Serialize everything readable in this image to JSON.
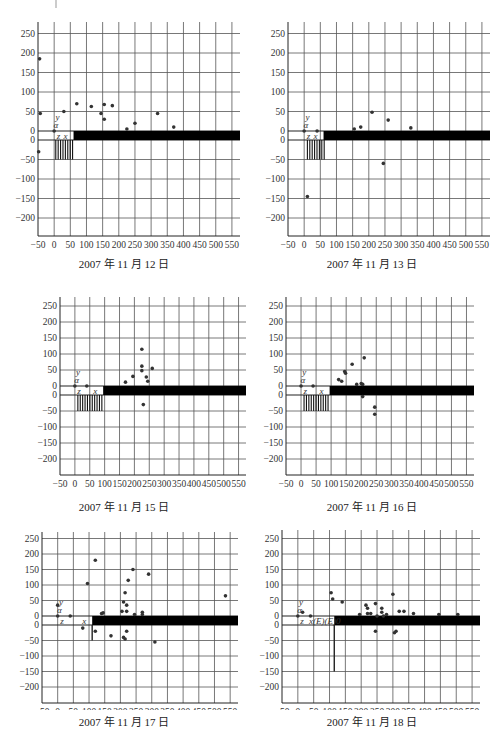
{
  "chart_data": [
    {
      "type": "scatter",
      "title": "2007 年 11 月 12 日",
      "xlabel": "x",
      "ylabel": "y",
      "xticks": [
        -50,
        0,
        50,
        100,
        150,
        200,
        250,
        300,
        350,
        400,
        450,
        500,
        550
      ],
      "yticks": [
        250,
        200,
        150,
        100,
        50,
        0,
        0,
        -50,
        -100,
        -150,
        -200
      ],
      "xlim": [
        -50,
        575
      ],
      "ylim": [
        -250,
        275
      ],
      "origin_labels": [
        "α",
        "y",
        "z",
        "x"
      ],
      "band": {
        "x_start": 60,
        "x_end": 575,
        "y_top": 8,
        "y_bottom": -8
      },
      "hatch": {
        "x_start": 5,
        "x_end": 60,
        "y_top": 0,
        "y_bottom": -50
      },
      "points": [
        [
          -45,
          185
        ],
        [
          -43,
          45
        ],
        [
          -48,
          -30
        ],
        [
          0,
          0
        ],
        [
          30,
          50
        ],
        [
          70,
          70
        ],
        [
          115,
          63
        ],
        [
          145,
          45
        ],
        [
          155,
          68
        ],
        [
          155,
          30
        ],
        [
          180,
          65
        ],
        [
          250,
          20
        ],
        [
          225,
          5
        ],
        [
          320,
          45
        ],
        [
          370,
          10
        ]
      ]
    },
    {
      "type": "scatter",
      "title": "2007 年 11 月 13 日",
      "xlabel": "x",
      "ylabel": "y",
      "xticks": [
        -50,
        0,
        50,
        100,
        150,
        200,
        250,
        300,
        350,
        400,
        450,
        500,
        550
      ],
      "yticks": [
        250,
        200,
        150,
        100,
        50,
        0,
        0,
        -50,
        -100,
        -150,
        -200
      ],
      "xlim": [
        -50,
        575
      ],
      "ylim": [
        -250,
        275
      ],
      "origin_labels": [
        "α",
        "y",
        "z",
        "x"
      ],
      "band": {
        "x_start": 60,
        "x_end": 575,
        "y_top": 8,
        "y_bottom": -8
      },
      "hatch": {
        "x_start": 10,
        "x_end": 65,
        "y_top": 0,
        "y_bottom": -50
      },
      "points": [
        [
          0,
          0
        ],
        [
          10,
          -145
        ],
        [
          40,
          0
        ],
        [
          155,
          5
        ],
        [
          175,
          10
        ],
        [
          210,
          48
        ],
        [
          245,
          -60
        ],
        [
          260,
          28
        ],
        [
          330,
          8
        ]
      ]
    },
    {
      "type": "scatter",
      "title": "2007 年 11 月 15 日",
      "xlabel": "x",
      "ylabel": "y",
      "xticks": [
        -50,
        0,
        50,
        100,
        150,
        200,
        250,
        300,
        350,
        400,
        450,
        500,
        550
      ],
      "yticks": [
        250,
        200,
        150,
        100,
        50,
        0,
        0,
        -50,
        -100,
        -150,
        -200
      ],
      "xlim": [
        -50,
        575
      ],
      "ylim": [
        -250,
        275
      ],
      "origin_labels": [
        "α",
        "y",
        "z",
        "x"
      ],
      "band": {
        "x_start": 95,
        "x_end": 575,
        "y_top": 8,
        "y_bottom": -8
      },
      "hatch": {
        "x_start": 10,
        "x_end": 95,
        "y_top": 0,
        "y_bottom": -50
      },
      "points": [
        [
          0,
          0
        ],
        [
          40,
          0
        ],
        [
          170,
          12
        ],
        [
          195,
          30
        ],
        [
          225,
          115
        ],
        [
          225,
          62
        ],
        [
          225,
          48
        ],
        [
          230,
          -30
        ],
        [
          240,
          28
        ],
        [
          245,
          15
        ],
        [
          260,
          55
        ]
      ]
    },
    {
      "type": "scatter",
      "title": "2007 年 11 月 16 日",
      "xlabel": "x",
      "ylabel": "y",
      "xticks": [
        -50,
        0,
        50,
        100,
        150,
        200,
        250,
        300,
        350,
        400,
        450,
        500,
        550
      ],
      "yticks": [
        250,
        200,
        150,
        100,
        50,
        0,
        0,
        -50,
        -100,
        -150,
        -200
      ],
      "xlim": [
        -50,
        575
      ],
      "ylim": [
        -250,
        275
      ],
      "origin_labels": [
        "α",
        "y",
        "z",
        "x"
      ],
      "band": {
        "x_start": 95,
        "x_end": 575,
        "y_top": 8,
        "y_bottom": -8
      },
      "hatch": {
        "x_start": 10,
        "x_end": 95,
        "y_top": 0,
        "y_bottom": -50
      },
      "points": [
        [
          0,
          0
        ],
        [
          40,
          0
        ],
        [
          125,
          20
        ],
        [
          135,
          15
        ],
        [
          145,
          45
        ],
        [
          148,
          40
        ],
        [
          170,
          68
        ],
        [
          185,
          5
        ],
        [
          200,
          8
        ],
        [
          205,
          5
        ],
        [
          210,
          88
        ],
        [
          205,
          -5
        ],
        [
          245,
          -38
        ],
        [
          245,
          -60
        ]
      ]
    },
    {
      "type": "scatter",
      "title": "2007 年 11 月 17 日",
      "xlabel": "x",
      "ylabel": "y",
      "xticks": [
        -50,
        0,
        50,
        100,
        150,
        200,
        250,
        300,
        350,
        400,
        450,
        500,
        550
      ],
      "yticks": [
        250,
        200,
        150,
        100,
        50,
        0,
        0,
        -50,
        -100,
        -150,
        -200
      ],
      "xlim": [
        -50,
        575
      ],
      "ylim": [
        -250,
        275
      ],
      "origin_labels": [
        "α",
        "y",
        "z",
        "x"
      ],
      "band": {
        "x_start": 110,
        "x_end": 575,
        "y_top": 8,
        "y_bottom": -8
      },
      "vline": {
        "x": 110,
        "y_top": 0,
        "y_bottom": -50
      },
      "points": [
        [
          0,
          35
        ],
        [
          0,
          0
        ],
        [
          40,
          0
        ],
        [
          95,
          105
        ],
        [
          80,
          -10
        ],
        [
          120,
          180
        ],
        [
          120,
          -20
        ],
        [
          145,
          10
        ],
        [
          140,
          8
        ],
        [
          170,
          -35
        ],
        [
          205,
          15
        ],
        [
          210,
          45
        ],
        [
          215,
          75
        ],
        [
          210,
          -40
        ],
        [
          215,
          -45
        ],
        [
          220,
          35
        ],
        [
          225,
          115
        ],
        [
          220,
          15
        ],
        [
          220,
          -20
        ],
        [
          240,
          150
        ],
        [
          245,
          5
        ],
        [
          270,
          12
        ],
        [
          270,
          5
        ],
        [
          290,
          135
        ],
        [
          310,
          -55
        ],
        [
          535,
          65
        ]
      ]
    },
    {
      "type": "scatter",
      "title": "2007 年 11 月 18 日",
      "xlabel": "x",
      "ylabel": "y",
      "xticks": [
        -50,
        0,
        50,
        100,
        150,
        200,
        250,
        300,
        350,
        400,
        450,
        500,
        550
      ],
      "yticks": [
        250,
        200,
        150,
        100,
        50,
        0,
        0,
        -50,
        -100,
        -150,
        -200
      ],
      "xlim": [
        -50,
        575
      ],
      "ylim": [
        -250,
        275
      ],
      "origin_labels": [
        "α",
        "y",
        "z",
        "x(E)(E)0"
      ],
      "band": {
        "x_start": 115,
        "x_end": 575,
        "y_top": 8,
        "y_bottom": -8
      },
      "vline": {
        "x": 115,
        "y_top": 0,
        "y_bottom": -150
      },
      "points": [
        [
          0,
          0
        ],
        [
          15,
          12
        ],
        [
          40,
          0
        ],
        [
          105,
          75
        ],
        [
          110,
          55
        ],
        [
          140,
          45
        ],
        [
          195,
          5
        ],
        [
          215,
          35
        ],
        [
          220,
          8
        ],
        [
          220,
          25
        ],
        [
          230,
          8
        ],
        [
          245,
          40
        ],
        [
          245,
          -20
        ],
        [
          250,
          0
        ],
        [
          265,
          25
        ],
        [
          265,
          12
        ],
        [
          270,
          0
        ],
        [
          280,
          5
        ],
        [
          300,
          70
        ],
        [
          305,
          -25
        ],
        [
          310,
          -20
        ],
        [
          320,
          15
        ],
        [
          335,
          15
        ],
        [
          365,
          8
        ],
        [
          445,
          5
        ],
        [
          505,
          5
        ]
      ]
    }
  ],
  "panels": [
    {
      "caption": "2007 年 11 月 12 日"
    },
    {
      "caption": "2007 年 11 月 13 日"
    },
    {
      "caption": "2007 年 11 月 15 日"
    },
    {
      "caption": "2007 年 11 月 16 日"
    },
    {
      "caption": "2007 年 11 月 17 日"
    },
    {
      "caption": "2007 年 11 月 18 日"
    }
  ],
  "colors": {
    "grid": "#555555",
    "axis": "#222222",
    "point": "#333333",
    "band": "#000000",
    "text": "#333333"
  }
}
